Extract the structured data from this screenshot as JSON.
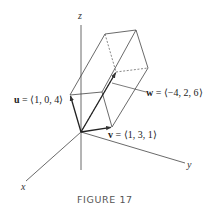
{
  "figure": {
    "caption": "FIGURE 17",
    "axes": {
      "x_label": "x",
      "y_label": "y",
      "z_label": "z"
    },
    "vectors": [
      {
        "name": "u",
        "components": "⟨1, 0, 4⟩",
        "label_eq": " = ⟨1, 0, 4⟩"
      },
      {
        "name": "v",
        "components": "⟨1, 3, 1⟩",
        "label_eq": " = ⟨1, 3, 1⟩"
      },
      {
        "name": "w",
        "components": "⟨−4, 2, 6⟩",
        "label_eq": " = ⟨−4, 2, 6⟩"
      }
    ],
    "shape": "parallelepiped",
    "colors": {
      "line": "#333333",
      "background": "#ffffff",
      "caption": "#555555"
    }
  }
}
